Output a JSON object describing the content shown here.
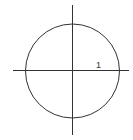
{
  "diagram": {
    "type": "unit-circle",
    "label": "1",
    "colors": {
      "stroke": "#333333",
      "background": "#ffffff"
    }
  }
}
